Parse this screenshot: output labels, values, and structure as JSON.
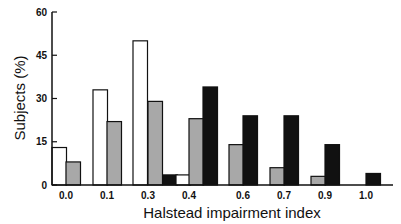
{
  "chart_data": {
    "type": "bar",
    "title": "",
    "xlabel": "Halstead impairment index",
    "ylabel": "Subjects (%)",
    "ylim": [
      0,
      60
    ],
    "yticks": [
      0,
      15,
      30,
      45,
      60
    ],
    "grid": false,
    "legend": null,
    "categories": [
      "0.0",
      "0.1",
      "0.3",
      "0.4",
      "0.6",
      "0.7",
      "0.9",
      "1.0"
    ],
    "series": [
      {
        "name": "group-white",
        "fill": "#ffffff",
        "values": [
          13,
          33,
          50,
          3.5,
          0,
          0,
          0,
          0
        ]
      },
      {
        "name": "group-gray",
        "fill": "#a8a8a8",
        "values": [
          8,
          22,
          29,
          23,
          14,
          6,
          3,
          0
        ]
      },
      {
        "name": "group-black",
        "fill": "#111111",
        "values": [
          0,
          0,
          3.5,
          34,
          24,
          24,
          14,
          4
        ]
      }
    ],
    "layout": {
      "bar_slots": [
        [
          52,
          66,
          null
        ],
        [
          93,
          107,
          null
        ],
        [
          133,
          148,
          163
        ],
        [
          176,
          189,
          203
        ],
        [
          null,
          229,
          243
        ],
        [
          null,
          270,
          284
        ],
        [
          null,
          311,
          325
        ],
        [
          null,
          null,
          366
        ]
      ],
      "label_x": [
        66,
        107,
        148,
        189,
        243,
        284,
        325,
        366
      ]
    }
  }
}
